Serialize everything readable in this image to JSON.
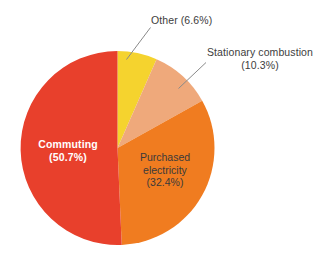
{
  "chart_data": {
    "type": "pie",
    "title": "",
    "legend": "none",
    "labels": [
      "Commuting",
      "Purchased electricity",
      "Stationary combustion",
      "Other"
    ],
    "values": [
      50.7,
      32.4,
      10.3,
      6.6
    ],
    "unit": "%",
    "start_angle_deg": 0,
    "direction": "clockwise",
    "colors": [
      "#E8402C",
      "#F07C20",
      "#EFA97B",
      "#F5D32E"
    ],
    "slices": [
      {
        "name": "Other",
        "value": 6.6,
        "color": "#F5D32E",
        "label_text": "Other (6.6%)",
        "label_placement": "outside",
        "label_lines": [
          "Other (6.6%)"
        ],
        "leader_line": true
      },
      {
        "name": "Stationary combustion",
        "value": 10.3,
        "color": "#EFA97B",
        "label_text": "Stationary combustion (10.3%)",
        "label_placement": "outside",
        "label_lines": [
          "Stationary combustion",
          "(10.3%)"
        ],
        "leader_line": true
      },
      {
        "name": "Purchased electricity",
        "value": 32.4,
        "color": "#F07C20",
        "label_text": "Purchased electricity (32.4%)",
        "label_placement": "inside",
        "label_lines": [
          "Purchased",
          "electricity",
          "(32.4%)"
        ],
        "leader_line": false
      },
      {
        "name": "Commuting",
        "value": 50.7,
        "color": "#E8402C",
        "label_text": "Commuting (50.7%)",
        "label_placement": "inside",
        "label_lines": [
          "Commuting",
          "(50.7%)"
        ],
        "leader_line": false
      }
    ]
  },
  "labels": {
    "other": "Other (6.6%)",
    "stationary_line1": "Stationary combustion",
    "stationary_line2": "(10.3%)",
    "commuting_line1": "Commuting",
    "commuting_line2": "(50.7%)",
    "purchased_line1": "Purchased",
    "purchased_line2": "electricity",
    "purchased_line3": "(32.4%)"
  },
  "colors": {
    "commuting": "#E8402C",
    "purchased_electricity": "#F07C20",
    "stationary_combustion": "#EFA97B",
    "other": "#F5D32E",
    "leader_line": "#8a8a8a",
    "background": "#FFFFFF",
    "label_text": "#3d3d3d",
    "inside_light_text": "#FFFFFF"
  }
}
